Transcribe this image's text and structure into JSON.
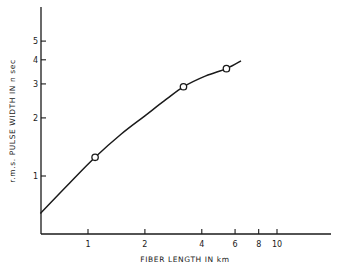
{
  "chart_data": {
    "type": "line",
    "title": "",
    "xlabel": "FIBER LENGTH IN km",
    "ylabel": "r.m.s. PULSE WIDTH IN n sec",
    "xscale": "log",
    "yscale": "log",
    "xlim": [
      0.56,
      30
    ],
    "ylim": [
      0.55,
      8
    ],
    "grid": false,
    "legend": null,
    "x_ticks": [
      {
        "value": 1,
        "label": "1"
      },
      {
        "value": 2,
        "label": "2"
      },
      {
        "value": 4,
        "label": "4"
      },
      {
        "value": 6,
        "label": "6"
      },
      {
        "value": 8,
        "label": "8"
      },
      {
        "value": 10,
        "label": "10"
      }
    ],
    "y_ticks": [
      {
        "value": 1,
        "label": "1"
      },
      {
        "value": 2,
        "label": "2"
      },
      {
        "value": 3,
        "label": "3"
      },
      {
        "value": 4,
        "label": "4"
      },
      {
        "value": 5,
        "label": "5"
      }
    ],
    "series": [
      {
        "name": "measured",
        "style": "open-circle-markers",
        "x": [
          1.09,
          3.2,
          5.4
        ],
        "y": [
          1.25,
          2.9,
          3.6
        ]
      },
      {
        "name": "fitted curve",
        "style": "solid-line",
        "x": [
          0.56,
          0.8,
          1.09,
          1.5,
          2.0,
          2.6,
          3.2,
          4.2,
          5.4,
          6.45
        ],
        "y": [
          0.64,
          0.92,
          1.25,
          1.65,
          2.05,
          2.5,
          2.9,
          3.3,
          3.6,
          3.95
        ]
      }
    ]
  },
  "labels": {
    "xlabel": "FIBER LENGTH IN km",
    "ylabel": "r.m.s. PULSE WIDTH IN n sec"
  }
}
